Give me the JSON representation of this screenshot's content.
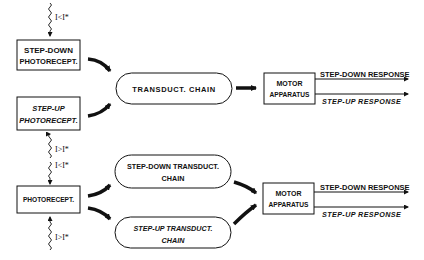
{
  "top_model": {
    "stimulus_label": "I<I*",
    "step_down_photoreceptor": {
      "line1": "STEP-DOWN",
      "line2": "PHOTORECEPT."
    },
    "step_up_photoreceptor": {
      "line1": "STEP-UP",
      "line2": "PHOTORECEPT."
    },
    "transduction_chain": "TRANSDUCT.  CHAIN",
    "motor_apparatus": {
      "line1": "MOTOR",
      "line2": "APPARATUS"
    },
    "outputs": {
      "step_down": "STEP-DOWN RESPONSE",
      "step_up": "STEP-UP RESPONSE"
    },
    "step_up_stimulus_label": "I>I*"
  },
  "bottom_model": {
    "stimulus_label_upper": "I<I*",
    "stimulus_label_lower": "I>I*",
    "photoreceptor": "PHOTORECEPT.",
    "step_down_chain": {
      "line1": "STEP-DOWN TRANSDUCT.",
      "line2": "CHAIN"
    },
    "step_up_chain": {
      "line1": "STEP-UP TRANSDUCT.",
      "line2": "CHAIN"
    },
    "motor_apparatus": {
      "line1": "MOTOR",
      "line2": "APPARATUS"
    },
    "outputs": {
      "step_down": "STEP-DOWN RESPONSE",
      "step_up": "STEP-UP RESPONSE"
    }
  },
  "colors": {
    "ink": "#111111",
    "background": "#ffffff"
  }
}
